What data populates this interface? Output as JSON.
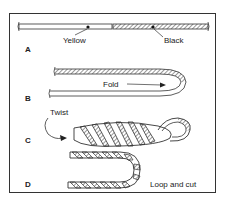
{
  "diagram": {
    "steps": [
      {
        "id": "A",
        "labels": [
          "Yellow",
          "Black"
        ]
      },
      {
        "id": "B",
        "labels": [
          "Fold"
        ]
      },
      {
        "id": "C",
        "labels": [
          "Twist"
        ]
      },
      {
        "id": "D",
        "labels": [
          "Loop and cut"
        ]
      }
    ]
  }
}
